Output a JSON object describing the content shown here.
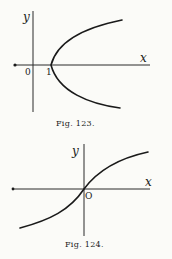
{
  "figures": [
    {
      "id": "fig-123",
      "caption": "Fig. 123.",
      "x_label": "x",
      "y_label": "y",
      "origin_label": "0",
      "tick_labels": [
        "1"
      ],
      "curve": "parabola opening right, vertex at (1, 0)"
    },
    {
      "id": "fig-124",
      "caption": "Fig. 124.",
      "x_label": "x",
      "y_label": "y",
      "origin_label": "O",
      "curve": "increasing S-shaped curve through origin"
    }
  ],
  "colors": {
    "background": "#fbfbf8",
    "ink": "#1a1a1a"
  }
}
